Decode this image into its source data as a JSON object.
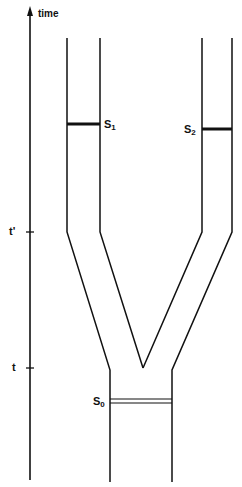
{
  "axis": {
    "label": "time",
    "ticks": [
      {
        "label": "t'",
        "y": 232
      },
      {
        "label": "t",
        "y": 368
      }
    ]
  },
  "sites": [
    {
      "id": "S1",
      "base": "S",
      "sub": "1",
      "branch": "left"
    },
    {
      "id": "S2",
      "base": "S",
      "sub": "2",
      "branch": "right"
    },
    {
      "id": "S0",
      "base": "S",
      "sub": "0",
      "branch": "trunk"
    }
  ],
  "colors": {
    "line": "#111111",
    "background": "#ffffff"
  }
}
